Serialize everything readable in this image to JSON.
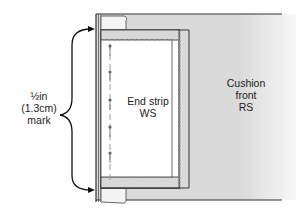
{
  "diagram": {
    "labels": {
      "mark": {
        "line1": "½in",
        "line2": "(1.3cm)",
        "line3": "mark"
      },
      "end_strip": {
        "line1": "End strip",
        "line2": "WS"
      },
      "cushion_front": {
        "line1": "Cushion",
        "line2": "front",
        "line3": "RS"
      }
    },
    "pins_count": 5,
    "colors": {
      "fabric_fill": "#dcdcdc",
      "strip_fill": "#ffffff",
      "outline": "#333333",
      "stitch": "#9a9a9a",
      "arrow": "#111111"
    }
  }
}
